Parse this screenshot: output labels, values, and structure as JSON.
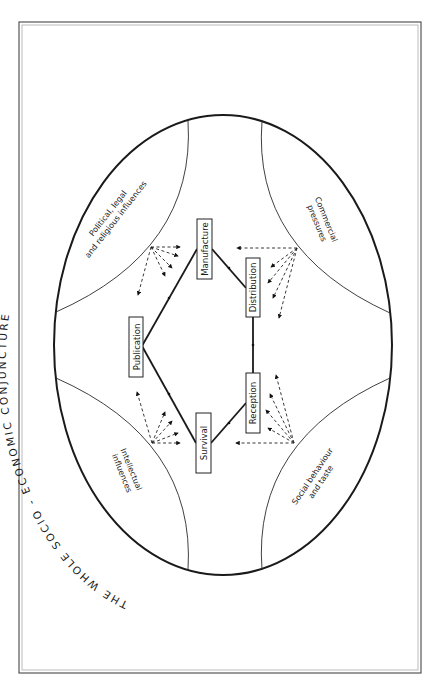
{
  "title": "THE WHOLE SOCIO - ECONOMIC CONJUNCTURE",
  "zones": {
    "political": {
      "line1": "Political, legal",
      "line2": "and religious influences"
    },
    "commercial": {
      "line1": "Commercial",
      "line2": "pressures"
    },
    "intellectual": {
      "line1": "Intellectual",
      "line2": "influences"
    },
    "social": {
      "line1": "Social behaviour",
      "line2": "and taste"
    }
  },
  "stages": {
    "publication": "Publication",
    "manufacture": "Manufacture",
    "distribution": "Distribution",
    "reception": "Reception",
    "survival": "Survival"
  },
  "colors": {
    "line": "#1a1a1a",
    "background": "#ffffff"
  }
}
